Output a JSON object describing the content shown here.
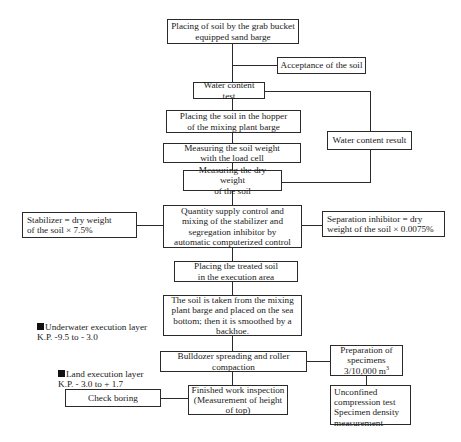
{
  "diagram": {
    "type": "flowchart",
    "nodes": {
      "placing_soil": "Placing of soil by the grab bucket\nequipped sand barge",
      "acceptance": "Acceptance of the soil",
      "water_test": "Water content test",
      "hopper": "Placing the soil in the hopper\nof the mixing plant barge",
      "soil_weight": "Measuring the soil weight\nwith the load cell",
      "dry_weight": "Measuring the dry weight\nof the soil",
      "water_result": "Water content result",
      "stabilizer": "Stabilizer = dry weight\nof the soil × 7.5%",
      "quantity_control": "Quantity supply control and\nmixing of the stabilizer and\nsegregation inhibitor by\nautomatic computerized control",
      "separation_inhibitor": "Separation inhibitor = dry\nweight of the soil  × 0.0075%",
      "treated_soil": "Placing the treated soil\nin the execution area",
      "sea_bottom": "The soil is taken from the mixing\nplant barge and placed on the sea\nbottom; then it is smoothed by a\nbackhoe.",
      "bulldozer": "Bulldozer spreading and roller\ncompaction",
      "preparation_line1": "Preparation of\nspecimens\n3/10,000 m",
      "preparation_sup": "3",
      "finished": "Finished work inspection\n(Measurement of height\nof top)",
      "check_boring": "Check boring",
      "unconfined": "Unconfined\ncompression test\nSpecimen density\nmeasurement"
    },
    "labels": {
      "underwater": "Underwater execution layer\n K.P. -9.5 to - 3.0",
      "land": "Land execution layer\n K.P. - 3.0 to + 1.7"
    },
    "edges": [
      [
        "placing_soil",
        "acceptance"
      ],
      [
        "placing_soil",
        "water_test"
      ],
      [
        "water_test",
        "hopper"
      ],
      [
        "water_test",
        "water_result"
      ],
      [
        "hopper",
        "soil_weight"
      ],
      [
        "soil_weight",
        "dry_weight"
      ],
      [
        "water_result",
        "dry_weight"
      ],
      [
        "dry_weight",
        "quantity_control"
      ],
      [
        "stabilizer",
        "quantity_control"
      ],
      [
        "separation_inhibitor",
        "quantity_control"
      ],
      [
        "quantity_control",
        "treated_soil"
      ],
      [
        "treated_soil",
        "sea_bottom"
      ],
      [
        "sea_bottom",
        "bulldozer"
      ],
      [
        "bulldozer",
        "preparation"
      ],
      [
        "preparation",
        "unconfined"
      ],
      [
        "bulldozer",
        "finished"
      ],
      [
        "finished",
        "check_boring"
      ]
    ]
  }
}
